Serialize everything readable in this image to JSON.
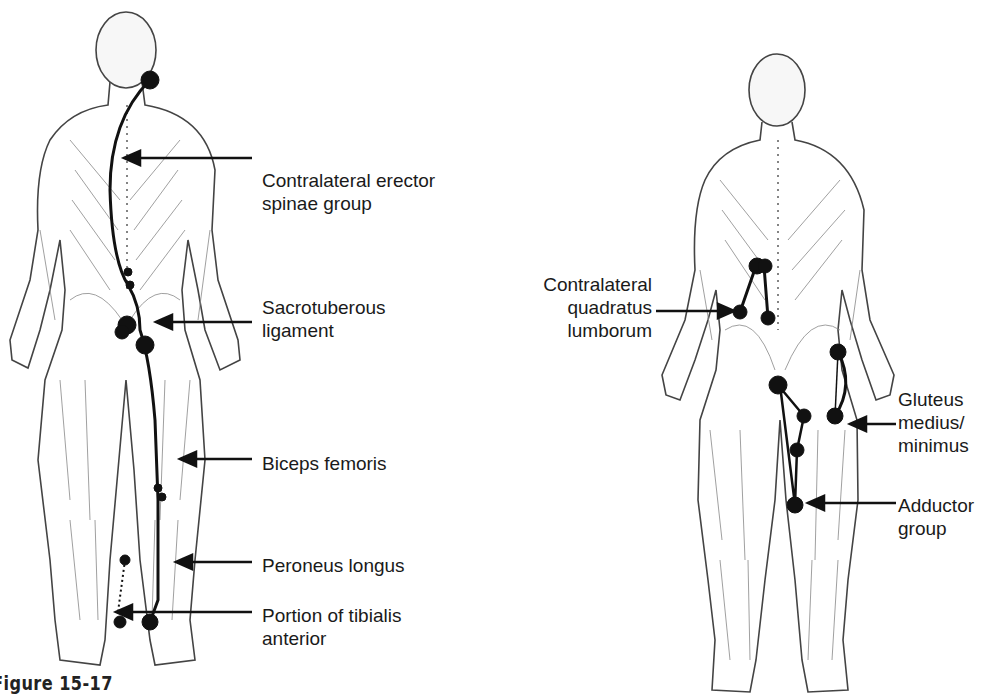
{
  "figure": {
    "caption": "Figure 15-17",
    "left_panel": {
      "labels": [
        {
          "text": "Contralateral erector\nspinae group",
          "x": 262,
          "y": 169
        },
        {
          "text": "Sacrotuberous\nligament",
          "x": 262,
          "y": 296
        },
        {
          "text": "Biceps femoris",
          "x": 262,
          "y": 452
        },
        {
          "text": "Peroneus longus",
          "x": 262,
          "y": 557
        },
        {
          "text": "Portion of tibialis\nanterior",
          "x": 262,
          "y": 607
        }
      ]
    },
    "right_panel": {
      "labels": [
        {
          "text": "Contralateral\nquadratus\nlumborum",
          "x": 514,
          "y": 274
        },
        {
          "text": "Gluteus\nmedius/\nminimus",
          "x": 898,
          "y": 388
        },
        {
          "text": "Adductor\ngroup",
          "x": 898,
          "y": 496
        }
      ]
    }
  },
  "colors": {
    "ink": "#1a1a1a",
    "background": "#ffffff",
    "sketch": "#555555"
  }
}
